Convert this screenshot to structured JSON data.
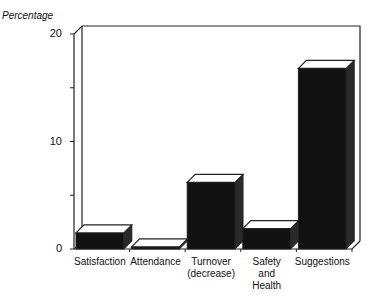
{
  "chart_data": {
    "type": "bar",
    "style": "3d",
    "title": "",
    "xlabel": "",
    "ylabel": "Percentage",
    "ylim": [
      0,
      20
    ],
    "yticks": [
      "0",
      "10",
      "20"
    ],
    "categories": [
      "Satisfaction",
      "Attendance",
      "Turnover (decrease)",
      "Safety and Health",
      "Suggestions"
    ],
    "category_lines": [
      [
        "Satisfaction"
      ],
      [
        "Attendance"
      ],
      [
        "Turnover",
        "(decrease)"
      ],
      [
        "Safety",
        "and",
        "Health"
      ],
      [
        "Suggestions"
      ]
    ],
    "values": [
      1.5,
      0.2,
      6.2,
      1.9,
      16.8
    ],
    "bar_color": "#111111",
    "grid": false,
    "legend": null
  }
}
